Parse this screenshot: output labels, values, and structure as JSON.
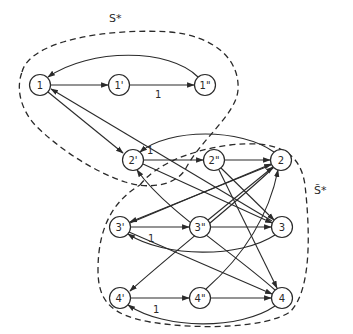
{
  "diagram": {
    "type": "directed-graph",
    "regions": [
      {
        "id": "S",
        "label": "S*"
      },
      {
        "id": "S_tilde",
        "label": "S̃*"
      }
    ],
    "nodes": [
      {
        "id": "n1",
        "label": "1"
      },
      {
        "id": "n1p",
        "label": "1'"
      },
      {
        "id": "n1pp",
        "label": "1\""
      },
      {
        "id": "n2p",
        "label": "2'"
      },
      {
        "id": "n2pp",
        "label": "2\""
      },
      {
        "id": "n2",
        "label": "2"
      },
      {
        "id": "n3p",
        "label": "3'"
      },
      {
        "id": "n3pp",
        "label": "3\""
      },
      {
        "id": "n3",
        "label": "3"
      },
      {
        "id": "n4p",
        "label": "4'"
      },
      {
        "id": "n4pp",
        "label": "4\""
      },
      {
        "id": "n4",
        "label": "4"
      }
    ],
    "edge_weight_labels": {
      "e1p_1pp": "1",
      "e2p_2pp": "1",
      "e3p_3pp": "1",
      "e4p_4pp": "1"
    },
    "edges": [
      {
        "from": "1",
        "to": "1'"
      },
      {
        "from": "1'",
        "to": "1\"",
        "weight": "1"
      },
      {
        "from": "1\"",
        "to": "1"
      },
      {
        "from": "1",
        "to": "2'"
      },
      {
        "from": "2'",
        "to": "2\"",
        "weight": "1"
      },
      {
        "from": "2\"",
        "to": "2"
      },
      {
        "from": "2",
        "to": "2'"
      },
      {
        "from": "3",
        "to": "1"
      },
      {
        "from": "3'",
        "to": "3\"",
        "weight": "1"
      },
      {
        "from": "3\"",
        "to": "3"
      },
      {
        "from": "3",
        "to": "3'"
      },
      {
        "from": "2",
        "to": "3'"
      },
      {
        "from": "4",
        "to": "2'"
      },
      {
        "from": "4'",
        "to": "4\"",
        "weight": "1"
      },
      {
        "from": "4\"",
        "to": "4"
      },
      {
        "from": "4",
        "to": "4'"
      },
      {
        "from": "2",
        "to": "4'"
      },
      {
        "from": "2'",
        "to": "3"
      },
      {
        "from": "2\"",
        "to": "3"
      },
      {
        "from": "2\"",
        "to": "4"
      },
      {
        "from": "3'",
        "to": "2"
      },
      {
        "from": "3\"",
        "to": "2"
      },
      {
        "from": "4\"",
        "to": "2"
      },
      {
        "from": "3'",
        "to": "4"
      }
    ]
  }
}
